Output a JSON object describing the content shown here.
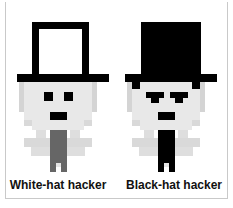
{
  "illustration": {
    "title": "White-hat hacker and Black-hat hacker",
    "background_color": "#ffffff",
    "border_color": "#c9c9c9",
    "width": 233,
    "height": 208
  },
  "palette": {
    "black": "#000000",
    "white": "#ffffff",
    "face_light": "#e8e8e8",
    "face_shadow": "#d4d4d4",
    "body_gray": "#666666",
    "caption_text": "#111111"
  },
  "figures": [
    {
      "id": "white-hat-hacker",
      "caption": "White-hat hacker",
      "hat": {
        "type": "top-hat-outline",
        "crown_fill": "#ffffff",
        "outline_color": "#000000",
        "brim_color": "#000000"
      },
      "face_color": "#e8e8e8",
      "eye_color": "#000000",
      "eye_style": "square",
      "brow_style": "none",
      "mouth_color": "#000000",
      "body_color": "#666666",
      "legs_color": "#666666",
      "feet_color": "#666666",
      "expression": "neutral"
    },
    {
      "id": "black-hat-hacker",
      "caption": "Black-hat hacker",
      "hat": {
        "type": "top-hat-solid",
        "crown_fill": "#000000",
        "outline_color": "#000000",
        "brim_color": "#000000"
      },
      "face_color": "#e8e8e8",
      "eye_color": "#000000",
      "eye_style": "angled-brow",
      "brow_style": "angry",
      "mouth_color": "#000000",
      "body_color": "#000000",
      "legs_color": "#000000",
      "feet_color": "#000000",
      "expression": "scowling"
    }
  ]
}
